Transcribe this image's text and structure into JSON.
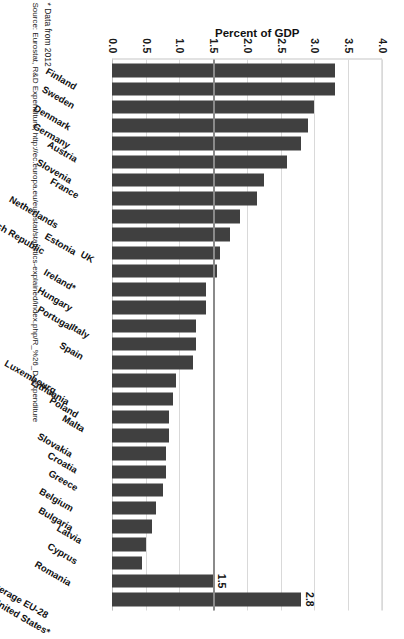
{
  "chart_data": {
    "type": "bar",
    "title": "",
    "xlabel": "",
    "ylabel": "Percent of GDP",
    "orientation": "vertical",
    "ylim": [
      0.0,
      4.0
    ],
    "ytick_labels": [
      "4.0",
      "3.5",
      "3.0",
      "2.5",
      "2.0",
      "1.5",
      "1.0",
      "0.5",
      "0.0"
    ],
    "ytick_values": [
      4.0,
      3.5,
      3.0,
      2.5,
      2.0,
      1.5,
      1.0,
      0.5,
      0.0
    ],
    "grid": true,
    "legend": false,
    "bar_color": "#404040",
    "reference_line": {
      "value": 1.5,
      "label": "1.5",
      "color": "#8a8a8a"
    },
    "categories": [
      "Finland",
      "Sweden",
      "Denmark",
      "Germany",
      "Austria",
      "Slovenia",
      "France",
      "Netherlands",
      "Czech Republic",
      "Estonia",
      "UK",
      "Ireland*",
      "Hungary",
      "Portugal",
      "Italy",
      "Spain",
      "Luxembourg",
      "Lithuania",
      "Poland",
      "Malta",
      "Slovakia",
      "Croatia",
      "Greece",
      "Belgium",
      "Bulgaria",
      "Latvia",
      "Cyprus",
      "Romania",
      "Average EU-28",
      "United States*"
    ],
    "values": [
      3.3,
      3.3,
      3.0,
      2.9,
      2.8,
      2.6,
      2.25,
      2.15,
      1.9,
      1.75,
      1.6,
      1.55,
      1.4,
      1.4,
      1.25,
      1.25,
      1.2,
      0.95,
      0.9,
      0.85,
      0.85,
      0.8,
      0.8,
      0.75,
      0.65,
      0.6,
      0.5,
      0.45,
      1.5,
      2.8
    ],
    "data_labels": {
      "Average EU-28": "1.5",
      "United States*": "2.8"
    }
  },
  "notes": {
    "footnote": "* Data from 2012",
    "source": "Source: Eurostat, R&D Expenditure, http://ec.europa.eu/eurostat/statistics-explained/index.php/R_%26_D_expenditure"
  }
}
